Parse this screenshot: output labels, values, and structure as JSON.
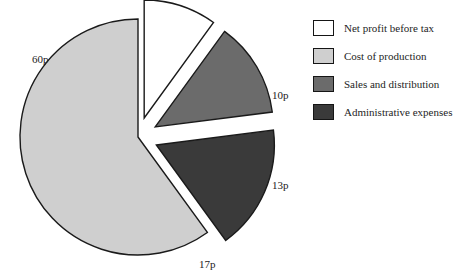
{
  "chart_data": {
    "type": "pie",
    "title": "",
    "subtitle": "",
    "xlabel": "",
    "ylabel": "",
    "unit": "p",
    "total": 100,
    "legend_position": "right",
    "grid": false,
    "categories": [
      "Net profit before tax",
      "Cost of production",
      "Sales and distribution",
      "Administrative expenses"
    ],
    "values": [
      10,
      60,
      13,
      17
    ],
    "data_labels": [
      "10p",
      "60p",
      "13p",
      "17p"
    ],
    "colors": [
      "#ffffff",
      "#cfcfcf",
      "#6b6b6b",
      "#3a3a3a"
    ],
    "slices": [
      {
        "label": "Cost of production",
        "value": 60,
        "data_label": "60p",
        "color": "#cfcfcf",
        "exploded": false,
        "label_x": 32,
        "label_y": 63
      },
      {
        "label": "Net profit before tax",
        "value": 10,
        "data_label": "10p",
        "color": "#ffffff",
        "exploded": true,
        "label_x": 272,
        "label_y": 99
      },
      {
        "label": "Sales and distribution",
        "value": 13,
        "data_label": "13p",
        "color": "#6b6b6b",
        "exploded": true,
        "label_x": 272,
        "label_y": 189
      },
      {
        "label": "Administrative expenses",
        "value": 17,
        "data_label": "17p",
        "color": "#3a3a3a",
        "exploded": true,
        "label_x": 199,
        "label_y": 268
      }
    ]
  },
  "legend": {
    "items": [
      {
        "label": "Net profit before tax",
        "color": "#ffffff"
      },
      {
        "label": "Cost of production",
        "color": "#cfcfcf"
      },
      {
        "label": "Sales and distribution",
        "color": "#6b6b6b"
      },
      {
        "label": "Administrative expenses",
        "color": "#3a3a3a"
      }
    ]
  }
}
